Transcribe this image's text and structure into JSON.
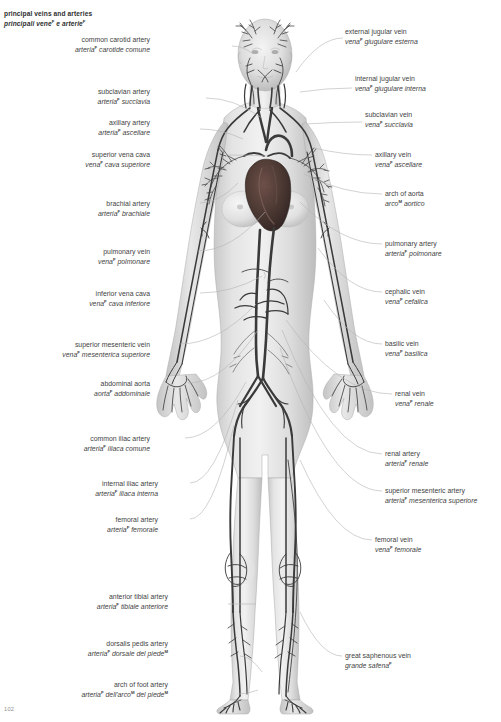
{
  "page": {
    "title_en": "principal veins and arteries",
    "title_it": "principali vene",
    "title_it_tail": " e arterie",
    "sup_marker": "F",
    "sup_marker_m": "M",
    "folio": "102",
    "background": "#ffffff",
    "text_color": "#3f3f3f",
    "vessel_color": "#3a3a3a",
    "heart_color": "#4a3a36",
    "body_color": "#d9d9d9",
    "leader_color": "#b4b4b4"
  },
  "figure": {
    "name": "anterior full-body female figure showing principal veins and arteries",
    "heart_label": "heart",
    "regions": [
      "head",
      "neck",
      "thorax",
      "abdomen",
      "pelvis",
      "arms",
      "hands",
      "legs",
      "feet"
    ]
  },
  "labels_left": [
    {
      "id": "common-carotid-artery",
      "en": "common carotid artery",
      "it": "arteria",
      "it_tail": " carotide comune",
      "sup": "F",
      "x": 150,
      "y": 36,
      "leader": [
        [
          232,
          46
        ],
        [
          252,
          53
        ]
      ]
    },
    {
      "id": "subclavian-artery",
      "en": "subclavian artery",
      "it": "arteria",
      "it_tail": " succlavia",
      "sup": "F",
      "x": 150,
      "y": 88,
      "leader": [
        [
          206,
          98
        ],
        [
          262,
          118
        ]
      ]
    },
    {
      "id": "axillary-artery",
      "en": "axillary artery",
      "it": "arteria",
      "it_tail": " ascellare",
      "sup": "F",
      "x": 150,
      "y": 119,
      "leader": [
        [
          200,
          129
        ],
        [
          243,
          139
        ]
      ]
    },
    {
      "id": "superior-vena-cava",
      "en": "superior vena cava",
      "it": "vena",
      "it_tail": " cava superiore",
      "sup": "F",
      "x": 150,
      "y": 151,
      "leader": [
        [
          228,
          155
        ],
        [
          268,
          156
        ]
      ]
    },
    {
      "id": "brachial-artery",
      "en": "brachial artery",
      "it": "arteria",
      "it_tail": " brachiale",
      "sup": "F",
      "x": 150,
      "y": 200,
      "leader": [
        [
          200,
          203
        ],
        [
          238,
          183
        ]
      ]
    },
    {
      "id": "pulmonary-vein",
      "en": "pulmonary vein",
      "it": "vena",
      "it_tail": " polmonare",
      "sup": "F",
      "x": 150,
      "y": 248,
      "leader": [
        [
          198,
          251
        ],
        [
          265,
          212
        ]
      ]
    },
    {
      "id": "inferior-vena-cava",
      "en": "inferior vena cava",
      "it": "vena",
      "it_tail": " cava inferiore",
      "sup": "F",
      "x": 150,
      "y": 290,
      "leader": [
        [
          200,
          293
        ],
        [
          262,
          276
        ]
      ]
    },
    {
      "id": "superior-mesenteric-vein",
      "en": "superior mesenteric vein",
      "it": "vena",
      "it_tail": " mesenterica superiore",
      "sup": "F",
      "x": 150,
      "y": 341,
      "leader": [
        [
          180,
          344
        ],
        [
          256,
          304
        ]
      ]
    },
    {
      "id": "abdominal-aorta",
      "en": "abdominal aorta",
      "it": "aorta",
      "it_tail": " addominale",
      "sup": "F",
      "x": 150,
      "y": 380,
      "leader": [
        [
          188,
          383
        ],
        [
          258,
          330
        ]
      ]
    },
    {
      "id": "common-iliac-artery",
      "en": "common iliac artery",
      "it": "arteria",
      "it_tail": " iliaca comune",
      "sup": "F",
      "x": 150,
      "y": 435,
      "leader": [
        [
          185,
          438
        ],
        [
          246,
          382
        ]
      ]
    },
    {
      "id": "internal-iliac-artery",
      "en": "internal iliac artery",
      "it": "arteria",
      "it_tail": " iliaca interna",
      "sup": "F",
      "x": 158,
      "y": 480,
      "leader": [
        [
          190,
          483
        ],
        [
          238,
          400
        ]
      ]
    },
    {
      "id": "femoral-artery",
      "en": "femoral artery",
      "it": "arteria",
      "it_tail": " femorale",
      "sup": "F",
      "x": 158,
      "y": 516,
      "leader": [
        [
          190,
          519
        ],
        [
          234,
          425
        ]
      ]
    },
    {
      "id": "anterior-tibial-artery",
      "en": "anterior tibial artery",
      "it": "arteria",
      "it_tail": " tibiale anteriore",
      "sup": "F",
      "x": 168,
      "y": 593,
      "leader": [
        [
          228,
          604
        ],
        [
          256,
          604
        ]
      ]
    },
    {
      "id": "dorsalis-pedis-artery",
      "en": "dorsalis pedis artery",
      "it": "arteria",
      "it_tail": " dorsale del piede",
      "sup": "F",
      "sup2": "M",
      "x": 168,
      "y": 640,
      "leader": [
        [
          240,
          656
        ],
        [
          262,
          672
        ]
      ]
    },
    {
      "id": "arch-of-foot-artery",
      "en": "arch of foot artery",
      "it": "arteria",
      "it_mid": " dell'arco",
      "it_tail": " del piede",
      "sup": "F",
      "sup2": "M",
      "sup3": "M",
      "x": 168,
      "y": 681,
      "leader": [
        [
          238,
          694
        ],
        [
          258,
          690
        ]
      ]
    }
  ],
  "labels_right": [
    {
      "id": "external-jugular-vein",
      "en": "external jugular vein",
      "it": "vena",
      "it_tail": " giugulare esterna",
      "sup": "F",
      "x": 345,
      "y": 28,
      "leader": [
        [
          343,
          38
        ],
        [
          296,
          72
        ]
      ]
    },
    {
      "id": "internal-jugular-vein",
      "en": "internal jugular vein",
      "it": "vena",
      "it_tail": " giugulare interna",
      "sup": "F",
      "x": 355,
      "y": 75,
      "leader": [
        [
          352,
          88
        ],
        [
          300,
          92
        ]
      ]
    },
    {
      "id": "subclavian-vein",
      "en": "subclavian vein",
      "it": "vena",
      "it_tail": " succlavia",
      "sup": "F",
      "x": 365,
      "y": 111,
      "leader": [
        [
          362,
          122
        ],
        [
          306,
          124
        ]
      ]
    },
    {
      "id": "axillary-vein",
      "en": "axillary vein",
      "it": "vena",
      "it_tail": " ascellare",
      "sup": "F",
      "x": 375,
      "y": 151,
      "leader": [
        [
          372,
          155
        ],
        [
          314,
          148
        ]
      ]
    },
    {
      "id": "arch-of-aorta",
      "en": "arch of aorta",
      "it": "arco",
      "it_tail": " aortico",
      "sup": "M",
      "x": 385,
      "y": 190,
      "leader": [
        [
          382,
          194
        ],
        [
          304,
          174
        ]
      ]
    },
    {
      "id": "pulmonary-artery",
      "en": "pulmonary artery",
      "it": "arteria",
      "it_tail": " polmonare",
      "sup": "F",
      "x": 385,
      "y": 240,
      "leader": [
        [
          382,
          244
        ],
        [
          300,
          202
        ]
      ]
    },
    {
      "id": "cephalic-vein",
      "en": "cephalic vein",
      "it": "vena",
      "it_tail": " cefalica",
      "sup": "F",
      "x": 385,
      "y": 288,
      "leader": [
        [
          382,
          292
        ],
        [
          318,
          248
        ]
      ]
    },
    {
      "id": "basilic-vein",
      "en": "basilic vein",
      "it": "vena",
      "it_tail": " basilica",
      "sup": "F",
      "x": 385,
      "y": 340,
      "leader": [
        [
          382,
          344
        ],
        [
          324,
          300
        ]
      ]
    },
    {
      "id": "renal-vein",
      "en": "renal vein",
      "it": "vena",
      "it_tail": " renale",
      "sup": "F",
      "x": 395,
      "y": 390,
      "leader": [
        [
          392,
          394
        ],
        [
          286,
          320
        ]
      ]
    },
    {
      "id": "renal-artery",
      "en": "renal artery",
      "it": "arteria",
      "it_tail": " renale",
      "sup": "F",
      "x": 385,
      "y": 450,
      "leader": [
        [
          382,
          454
        ],
        [
          282,
          330
        ]
      ]
    },
    {
      "id": "superior-mesenteric-artery",
      "en": "superior mesenteric artery",
      "it": "arteria",
      "it_tail": " mesenterica superiore",
      "sup": "F",
      "x": 385,
      "y": 487,
      "leader": [
        [
          382,
          491
        ],
        [
          280,
          348
        ]
      ]
    },
    {
      "id": "femoral-vein",
      "en": "femoral vein",
      "it": "vena",
      "it_tail": " femorale",
      "sup": "F",
      "x": 375,
      "y": 536,
      "leader": [
        [
          372,
          540
        ],
        [
          300,
          460
        ]
      ]
    },
    {
      "id": "great-saphenous-vein",
      "en": "great saphenous vein",
      "it": "grande safena",
      "it_tail": "",
      "sup": "F",
      "x": 345,
      "y": 652,
      "leader": [
        [
          342,
          656
        ],
        [
          300,
          612
        ]
      ]
    }
  ]
}
